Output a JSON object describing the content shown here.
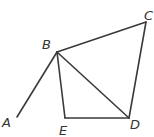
{
  "diagram": {
    "type": "geometry-figure",
    "stroke_color": "#3a3a3a",
    "points": {
      "A": {
        "label": "A",
        "x": 17,
        "y": 117,
        "lx": 2,
        "ly": 127
      },
      "B": {
        "label": "B",
        "x": 57,
        "y": 52,
        "lx": 42,
        "ly": 49
      },
      "C": {
        "label": "C",
        "x": 146,
        "y": 22,
        "lx": 144,
        "ly": 20
      },
      "D": {
        "label": "D",
        "x": 129,
        "y": 118,
        "lx": 130,
        "ly": 129
      },
      "E": {
        "label": "E",
        "x": 65,
        "y": 118,
        "lx": 59,
        "ly": 135
      }
    },
    "segments": [
      [
        "A",
        "B"
      ],
      [
        "B",
        "C"
      ],
      [
        "C",
        "D"
      ],
      [
        "B",
        "D"
      ],
      [
        "B",
        "E"
      ],
      [
        "E",
        "D"
      ]
    ]
  }
}
